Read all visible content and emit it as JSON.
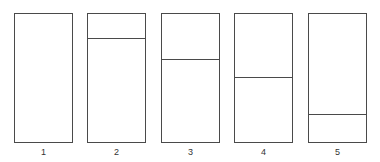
{
  "diagram": {
    "panels": [
      {
        "label": "1",
        "divider_fraction_from_top": null
      },
      {
        "label": "2",
        "divider_fraction_from_top": 0.19
      },
      {
        "label": "3",
        "divider_fraction_from_top": 0.35
      },
      {
        "label": "4",
        "divider_fraction_from_top": 0.49
      },
      {
        "label": "5",
        "divider_fraction_from_top": 0.78
      }
    ]
  }
}
